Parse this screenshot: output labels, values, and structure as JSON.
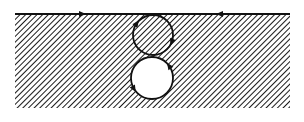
{
  "figure": {
    "colors": {
      "background": "#ffffff",
      "ink": "#111111",
      "hatch": "#1a1a1a"
    },
    "region": {
      "x": 15,
      "y": 14,
      "width": 275,
      "height": 94,
      "fill": "hatched"
    },
    "boundary_line": {
      "x1": 15,
      "y1": 14,
      "x2": 290,
      "y2": 14,
      "arrows": [
        {
          "x": 82,
          "direction": "right"
        },
        {
          "x": 220,
          "direction": "left"
        }
      ]
    },
    "circles": [
      {
        "name": "upper-circle",
        "cx": 153,
        "cy": 35,
        "r": 20,
        "fill": "hatched",
        "arrows": [
          {
            "angle_deg": 20,
            "direction": "clockwise"
          },
          {
            "angle_deg": 215,
            "direction": "clockwise"
          }
        ]
      },
      {
        "name": "lower-circle",
        "cx": 152,
        "cy": 78,
        "r": 21,
        "fill": "white",
        "arrows": [
          {
            "angle_deg": 150,
            "direction": "counterclockwise"
          },
          {
            "angle_deg": 325,
            "direction": "counterclockwise"
          }
        ]
      }
    ]
  }
}
